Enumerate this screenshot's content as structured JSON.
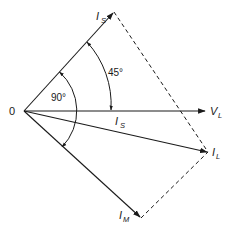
{
  "diagram": {
    "type": "phasor-diagram",
    "origin_label": "0",
    "phasors": [
      {
        "id": "is-upper",
        "label": "I",
        "subscript": "S",
        "angle_deg": 45
      },
      {
        "id": "vl",
        "label": "V",
        "subscript": "L",
        "angle_deg": 0
      },
      {
        "id": "is-lower",
        "label": "I",
        "subscript": "S",
        "angle_deg": -15
      },
      {
        "id": "il",
        "label": "I",
        "subscript": "L",
        "angle_deg": -17
      },
      {
        "id": "im",
        "label": "I",
        "subscript": "M",
        "angle_deg": -45
      }
    ],
    "angles": [
      {
        "id": "angle-90",
        "label": "90°",
        "between": [
          "is-upper",
          "im"
        ]
      },
      {
        "id": "angle-45",
        "label": "45°",
        "between": [
          "is-upper",
          "vl"
        ]
      }
    ],
    "construction_lines": [
      {
        "from": "is-upper",
        "to": "il",
        "style": "dashed"
      },
      {
        "from": "im",
        "to": "il",
        "style": "dashed"
      }
    ]
  }
}
